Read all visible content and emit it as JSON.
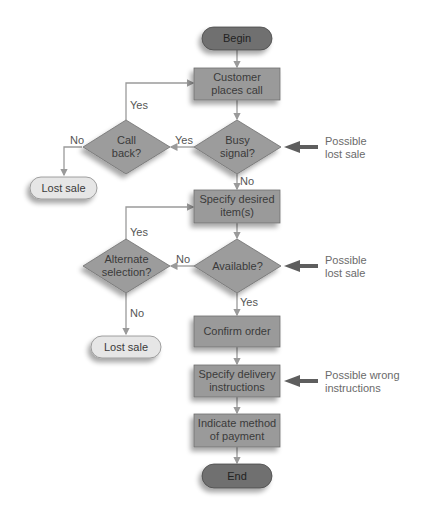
{
  "colors": {
    "terminal": "#6f6f6f",
    "process": "#9a9a9a",
    "decision": "#9c9c9c",
    "lost_sale": "#e6e6e6",
    "connector": "#9a9a9a",
    "risk_arrow": "#5e5e5e",
    "annotation_text": "#6a6a6a"
  },
  "nodes": {
    "begin": "Begin",
    "customer_places_call": [
      "Customer",
      "places call"
    ],
    "busy_signal": [
      "Busy",
      "signal?"
    ],
    "call_back": [
      "Call",
      "back?"
    ],
    "lost_sale_1": "Lost sale",
    "specify_items": [
      "Specify desired",
      "item(s)"
    ],
    "available": "Available?",
    "alternate_selection": [
      "Alternate",
      "selection?"
    ],
    "lost_sale_2": "Lost sale",
    "confirm_order": "Confirm order",
    "specify_delivery": [
      "Specify delivery",
      "instructions"
    ],
    "indicate_payment": [
      "Indicate method",
      "of payment"
    ],
    "end": "End"
  },
  "edge_labels": {
    "busy_yes": "Yes",
    "busy_no": "No",
    "callback_yes": "Yes",
    "callback_no": "No",
    "available_no": "No",
    "available_yes": "Yes",
    "alternate_yes": "Yes",
    "alternate_no": "No"
  },
  "annotations": {
    "busy": [
      "Possible",
      "lost sale"
    ],
    "available": [
      "Possible",
      "lost sale"
    ],
    "delivery": [
      "Possible wrong",
      "instructions"
    ]
  }
}
